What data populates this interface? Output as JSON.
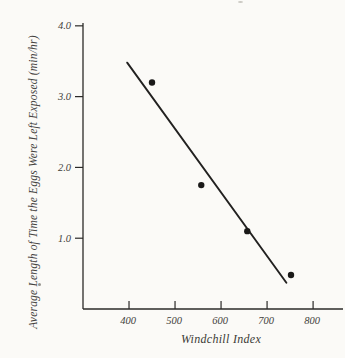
{
  "figure": {
    "background_color": "#fbfaf7",
    "ink_color": "#2b2a28",
    "point_color": "#1a1918",
    "line_color": "#222120"
  },
  "chart_data": {
    "type": "scatter",
    "title": "",
    "xlabel": "Windchill Index",
    "ylabel": "Average Length of Time the Eggs Were Left Exposed (min/hr)",
    "x_ticks": [
      400,
      500,
      600,
      700,
      800
    ],
    "x_tick_labels": [
      "400",
      "500",
      "600",
      "700",
      "800"
    ],
    "y_ticks": [
      1.0,
      2.0,
      3.0,
      4.0
    ],
    "y_tick_labels": [
      "1.0",
      "2.0",
      "3.0",
      "4.0"
    ],
    "xlim": [
      300,
      865
    ],
    "ylim": [
      0,
      4.04
    ],
    "grid": false,
    "legend": "none",
    "points": [
      {
        "x": 450,
        "y": 3.2
      },
      {
        "x": 557,
        "y": 1.75
      },
      {
        "x": 657,
        "y": 1.1
      },
      {
        "x": 752,
        "y": 0.48
      }
    ],
    "regression_line": {
      "x1": 396,
      "y1": 3.48,
      "x2": 742,
      "y2": 0.37
    }
  }
}
